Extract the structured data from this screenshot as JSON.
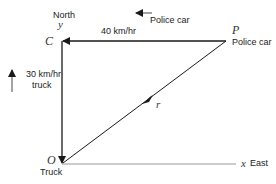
{
  "diagram": {
    "labels": {
      "north": "North",
      "y_axis": "y",
      "point_c": "C",
      "point_p": "P",
      "point_o": "O",
      "police_car_top": "Police car",
      "police_car_p": "Police car",
      "police_speed": "40 km/hr",
      "truck_speed": "30 km/hr",
      "truck_word": "truck",
      "truck_o": "Truck",
      "r_vector": "r⃗",
      "x_axis": "x",
      "east": "East"
    },
    "colors": {
      "line": "#1a1a1a",
      "axis": "#999999",
      "text": "#222222"
    }
  }
}
